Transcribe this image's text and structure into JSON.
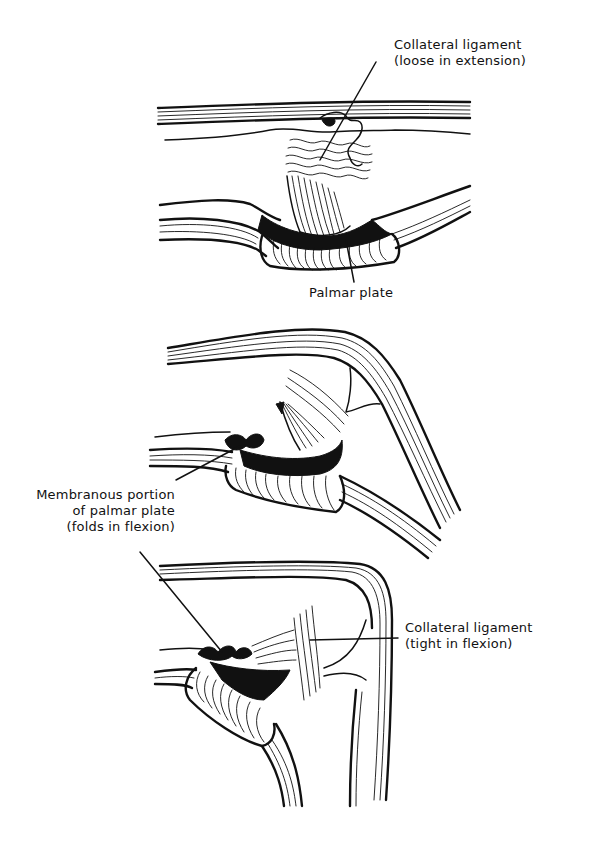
{
  "figure": {
    "panels": [
      {
        "id": "extension",
        "labels": [
          {
            "line1": "Collateral ligament",
            "line2": "(loose in extension)"
          },
          {
            "line1": "Palmar plate"
          }
        ]
      },
      {
        "id": "partial-flexion",
        "labels": [
          {
            "line1": "Membranous portion",
            "line2": "of palmar plate",
            "line3": "(folds in flexion)"
          }
        ]
      },
      {
        "id": "full-flexion",
        "labels": [
          {
            "line1": "Collateral ligament",
            "line2": "(tight in flexion)"
          }
        ]
      }
    ]
  }
}
